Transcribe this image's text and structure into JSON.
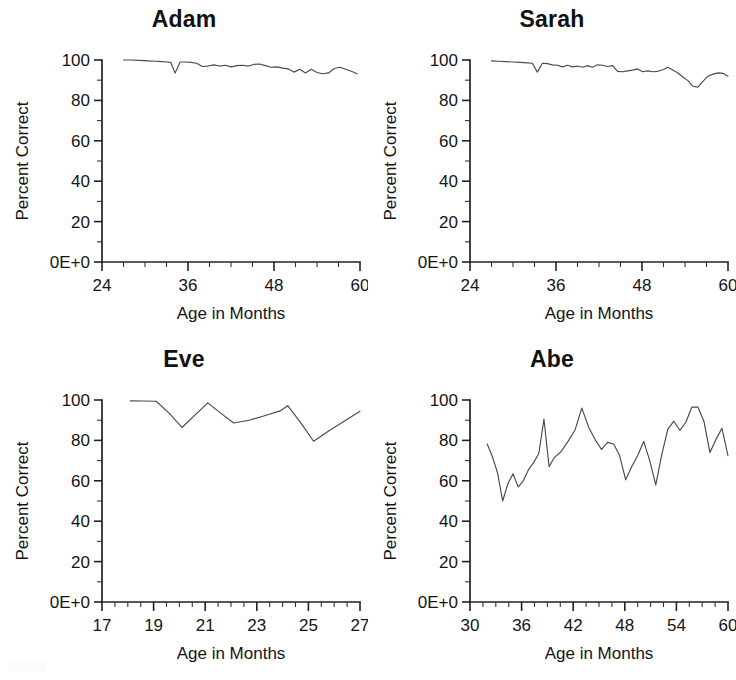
{
  "figure": {
    "background": "#ffffff",
    "line_color": "#4a4a4a",
    "axis_color": "#222222",
    "panel_count": 4
  },
  "axis_common": {
    "ylabel": "Percent Correct",
    "xlabel": "Age in Months",
    "y_ticks": [
      "0E+0",
      "20",
      "40",
      "60",
      "80",
      "100"
    ],
    "y_tick_values": [
      0,
      20,
      40,
      60,
      80,
      100
    ],
    "ylim": [
      0,
      100
    ],
    "minor_ticks_per_major_y": 2,
    "grid": "off",
    "legend": "none"
  },
  "panels": [
    {
      "title": "Adam",
      "x_ticks": [
        "24",
        "36",
        "48",
        "60"
      ],
      "x_tick_values": [
        24,
        36,
        48,
        60
      ],
      "xlim": [
        24,
        60
      ],
      "minor_tick_step_x": 3
    },
    {
      "title": "Sarah",
      "x_ticks": [
        "24",
        "36",
        "48",
        "60"
      ],
      "x_tick_values": [
        24,
        36,
        48,
        60
      ],
      "xlim": [
        24,
        60
      ],
      "minor_tick_step_x": 3
    },
    {
      "title": "Eve",
      "x_ticks": [
        "17",
        "19",
        "21",
        "23",
        "25",
        "27"
      ],
      "x_tick_values": [
        17,
        19,
        21,
        23,
        25,
        27
      ],
      "xlim": [
        17,
        27
      ],
      "minor_tick_step_x": 0.5
    },
    {
      "title": "Abe",
      "x_ticks": [
        "30",
        "36",
        "42",
        "48",
        "54",
        "60"
      ],
      "x_tick_values": [
        30,
        36,
        42,
        48,
        54,
        60
      ],
      "xlim": [
        30,
        60
      ],
      "minor_tick_step_x": 1.5
    }
  ],
  "chart_data": [
    {
      "type": "line",
      "title": "Adam",
      "xlabel": "Age in Months",
      "ylabel": "Percent Correct",
      "xlim": [
        24,
        60
      ],
      "ylim": [
        0,
        100
      ],
      "grid": false,
      "legend": null,
      "x": [
        27.0,
        28.1,
        29.2,
        30.3,
        31.4,
        32.5,
        33.0,
        33.6,
        34.2,
        34.9,
        35.6,
        36.4,
        37.2,
        38.0,
        38.8,
        39.6,
        40.4,
        41.2,
        42.0,
        42.8,
        43.6,
        44.4,
        45.2,
        46.0,
        46.8,
        47.6,
        48.4,
        49.2,
        50.0,
        50.8,
        51.6,
        52.4,
        53.2,
        54.0,
        54.8,
        55.6,
        56.4,
        57.2,
        58.0,
        58.8,
        59.6
      ],
      "y": [
        100.0,
        100.0,
        99.8,
        99.6,
        99.4,
        99.2,
        99.0,
        98.8,
        93.5,
        99.0,
        99.0,
        98.8,
        98.4,
        96.8,
        97.0,
        97.6,
        97.0,
        97.4,
        96.6,
        97.2,
        97.4,
        97.0,
        97.8,
        98.0,
        97.2,
        96.4,
        96.6,
        96.0,
        95.6,
        94.0,
        95.4,
        93.6,
        95.4,
        93.8,
        93.2,
        93.6,
        95.8,
        96.4,
        95.4,
        94.4,
        93.2
      ]
    },
    {
      "type": "line",
      "title": "Sarah",
      "xlabel": "Age in Months",
      "ylabel": "Percent Correct",
      "xlim": [
        24,
        60
      ],
      "ylim": [
        0,
        100
      ],
      "grid": false,
      "legend": null,
      "x": [
        27.0,
        28.0,
        29.0,
        30.0,
        31.0,
        32.0,
        32.7,
        33.4,
        34.1,
        34.8,
        35.5,
        36.2,
        36.9,
        37.6,
        38.3,
        39.0,
        39.7,
        40.4,
        41.1,
        41.8,
        42.5,
        43.2,
        43.9,
        44.6,
        45.3,
        46.0,
        46.7,
        47.4,
        48.1,
        48.8,
        49.5,
        50.2,
        50.9,
        51.6,
        52.3,
        53.0,
        53.7,
        54.4,
        55.1,
        55.8,
        56.5,
        57.2,
        57.9,
        58.6,
        59.3,
        60.0
      ],
      "y": [
        99.6,
        99.4,
        99.2,
        99.0,
        98.8,
        98.6,
        98.4,
        94.0,
        98.4,
        98.2,
        97.6,
        97.4,
        96.6,
        97.4,
        96.6,
        97.0,
        96.4,
        97.2,
        96.4,
        97.6,
        97.4,
        96.8,
        97.2,
        94.4,
        94.2,
        94.6,
        95.0,
        95.6,
        94.2,
        94.6,
        94.2,
        94.4,
        95.2,
        96.4,
        95.0,
        93.6,
        91.6,
        89.8,
        87.0,
        86.6,
        89.4,
        92.0,
        93.0,
        93.6,
        93.4,
        92.0
      ]
    },
    {
      "type": "line",
      "title": "Eve",
      "xlabel": "Age in Months",
      "ylabel": "Percent Correct",
      "xlim": [
        17,
        27
      ],
      "ylim": [
        0,
        100
      ],
      "grid": false,
      "legend": null,
      "x": [
        18.1,
        18.6,
        19.1,
        19.6,
        20.1,
        20.6,
        21.1,
        21.6,
        22.1,
        22.7,
        23.3,
        23.9,
        24.2,
        24.7,
        25.2,
        25.8,
        26.4,
        27.0
      ],
      "y": [
        99.6,
        99.5,
        99.4,
        93.5,
        86.4,
        92.5,
        98.6,
        93.5,
        88.6,
        90.0,
        92.2,
        94.6,
        97.2,
        88.8,
        79.6,
        84.8,
        89.6,
        94.4
      ]
    },
    {
      "type": "line",
      "title": "Abe",
      "xlabel": "Age in Months",
      "ylabel": "Percent Correct",
      "xlim": [
        30,
        60
      ],
      "ylim": [
        0,
        100
      ],
      "grid": false,
      "legend": null,
      "x": [
        32.0,
        32.6,
        33.2,
        33.8,
        34.4,
        35.0,
        35.6,
        36.2,
        36.8,
        37.4,
        38.0,
        38.6,
        39.2,
        39.8,
        40.6,
        41.4,
        42.2,
        43.0,
        43.8,
        44.6,
        45.3,
        46.0,
        46.7,
        47.4,
        48.1,
        48.8,
        49.5,
        50.2,
        50.9,
        51.6,
        52.3,
        53.0,
        53.7,
        54.4,
        55.1,
        55.8,
        56.5,
        57.2,
        57.9,
        58.6,
        59.3,
        60.0
      ],
      "y": [
        78.2,
        72.0,
        64.0,
        50.0,
        58.5,
        63.5,
        57.0,
        60.0,
        65.5,
        69.0,
        73.5,
        90.5,
        67.0,
        71.5,
        74.5,
        79.5,
        85.0,
        96.0,
        86.5,
        80.0,
        75.5,
        79.0,
        78.2,
        72.5,
        60.5,
        67.0,
        72.5,
        79.5,
        70.0,
        58.0,
        73.0,
        85.5,
        89.5,
        85.0,
        89.0,
        96.5,
        96.5,
        89.5,
        74.0,
        80.5,
        86.0,
        72.5
      ]
    }
  ]
}
